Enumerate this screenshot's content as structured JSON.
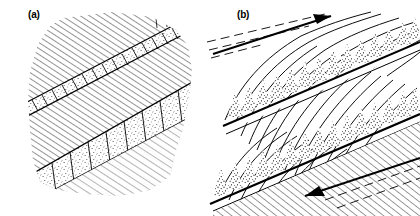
{
  "figure": {
    "background_color": "#ffffff",
    "ink_color": "#000000",
    "width": 420,
    "height": 216
  },
  "panels": [
    {
      "id": "a",
      "label": "(a)",
      "description": "Diagonally hatched host rock cut by two stippled layers segmented into rectangular blocks by steep fractures (boudinage / segmented veins).",
      "hatch_angle_deg": 57,
      "bands": [
        {
          "name": "upper-band",
          "thickness_px": 13,
          "segment_count": 17,
          "fill": "stipple-light"
        },
        {
          "name": "lower-band",
          "thickness_px": 38,
          "segment_count": 11,
          "fill": "stipple-light"
        }
      ]
    },
    {
      "id": "b",
      "label": "(b)",
      "description": "Sigmoidally curved foliation traces deflected into two stippled shear bands with flame-shaped stipple tufts; paired shear-sense arrows indicate dextral simple shear.",
      "bands": [
        {
          "name": "upper-shear-band",
          "tuft_count": 16,
          "fill": "stipple-tufts"
        },
        {
          "name": "lower-shear-band",
          "tuft_count": 18,
          "fill": "stipple-tufts"
        }
      ],
      "arrows": [
        {
          "name": "top-shear-arrow",
          "direction": "to-upper-right"
        },
        {
          "name": "bottom-shear-arrow",
          "direction": "to-lower-left"
        }
      ]
    }
  ]
}
